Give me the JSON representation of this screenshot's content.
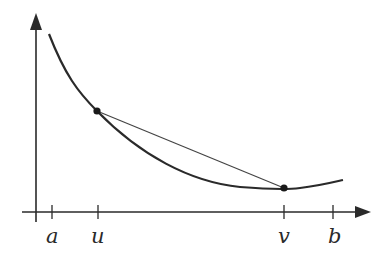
{
  "diagram": {
    "type": "convex-function-chord",
    "colors": {
      "axis": "#2a2a2a",
      "curve": "#2a2a2a",
      "chord": "#444444",
      "point": "#1a1a1a",
      "label": "#2a2a2a"
    },
    "axis_labels": {
      "a": "a",
      "u": "u",
      "v": "v",
      "b": "b"
    },
    "points": [
      {
        "name": "point-u",
        "label": "u"
      },
      {
        "name": "point-v",
        "label": "v"
      }
    ]
  }
}
